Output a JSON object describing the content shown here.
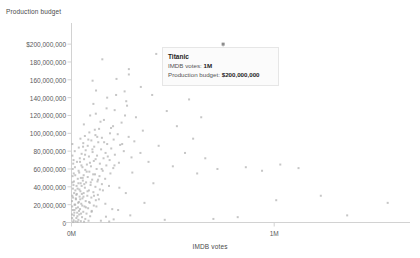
{
  "chart_data": {
    "type": "scatter",
    "title": "",
    "xlabel": "IMDB votes",
    "ylabel": "Production budget",
    "xlim": [
      0,
      1670000
    ],
    "ylim": [
      0,
      208000000
    ],
    "grid": false,
    "legend": "none",
    "x_ticks": [
      {
        "value": 0,
        "label": "0M"
      },
      {
        "value": 1000000,
        "label": "1M"
      }
    ],
    "y_ticks": [
      {
        "value": 0,
        "label": "0"
      },
      {
        "value": 20000000,
        "label": "20,000,000"
      },
      {
        "value": 40000000,
        "label": "40,000,000"
      },
      {
        "value": 60000000,
        "label": "60,000,000"
      },
      {
        "value": 80000000,
        "label": "80,000,000"
      },
      {
        "value": 100000000,
        "label": "100,000,000"
      },
      {
        "value": 120000000,
        "label": "120,000,000"
      },
      {
        "value": 140000000,
        "label": "140,000,000"
      },
      {
        "value": 160000000,
        "label": "160,000,000"
      },
      {
        "value": 180000000,
        "label": "180,000,000"
      },
      {
        "value": 200000000,
        "label": "$200,000,000"
      }
    ],
    "point_color": "#b0b0b0",
    "axis_color": "#d2d2d2",
    "highlight_color": "#8c8c8c",
    "series": [
      {
        "name": "films",
        "points": [
          [
            748000,
            200000000
          ],
          [
            748000,
            185000000
          ],
          [
            418000,
            189000000
          ],
          [
            152000,
            183000000
          ],
          [
            283000,
            172000000
          ],
          [
            283000,
            166000000
          ],
          [
            222000,
            161000000
          ],
          [
            104000,
            159000000
          ],
          [
            342000,
            152000000
          ],
          [
            121000,
            148000000
          ],
          [
            262000,
            147000000
          ],
          [
            398000,
            143000000
          ],
          [
            176000,
            140000000
          ],
          [
            270000,
            136000000
          ],
          [
            108000,
            133000000
          ],
          [
            274000,
            131000000
          ],
          [
            213000,
            126000000
          ],
          [
            120000,
            122000000
          ],
          [
            92000,
            120000000
          ],
          [
            318000,
            118000000
          ],
          [
            160000,
            115000000
          ],
          [
            247000,
            112000000
          ],
          [
            61000,
            110000000
          ],
          [
            205000,
            108000000
          ],
          [
            136000,
            105000000
          ],
          [
            352000,
            103000000
          ],
          [
            88000,
            101000000
          ],
          [
            190000,
            100000000
          ],
          [
            228000,
            99000000
          ],
          [
            118000,
            98000000
          ],
          [
            66000,
            97000000
          ],
          [
            282000,
            96000000
          ],
          [
            150000,
            95000000
          ],
          [
            44000,
            94000000
          ],
          [
            208000,
            93000000
          ],
          [
            98000,
            92000000
          ],
          [
            310000,
            91000000
          ],
          [
            132000,
            90000000
          ],
          [
            58000,
            89000000
          ],
          [
            176000,
            88000000
          ],
          [
            240000,
            87000000
          ],
          [
            80000,
            86000000
          ],
          [
            112000,
            85000000
          ],
          [
            36000,
            84000000
          ],
          [
            196000,
            83000000
          ],
          [
            146000,
            82000000
          ],
          [
            70000,
            81000000
          ],
          [
            258000,
            80000000
          ],
          [
            104000,
            79000000
          ],
          [
            168000,
            78000000
          ],
          [
            50000,
            77000000
          ],
          [
            214000,
            76000000
          ],
          [
            126000,
            75000000
          ],
          [
            86000,
            74000000
          ],
          [
            296000,
            73000000
          ],
          [
            158000,
            72000000
          ],
          [
            62000,
            71000000
          ],
          [
            188000,
            70000000
          ],
          [
            110000,
            69000000
          ],
          [
            42000,
            68000000
          ],
          [
            234000,
            67000000
          ],
          [
            140000,
            66000000
          ],
          [
            76000,
            65000000
          ],
          [
            172000,
            64000000
          ],
          [
            96000,
            63000000
          ],
          [
            54000,
            62000000
          ],
          [
            206000,
            61000000
          ],
          [
            124000,
            60000000
          ],
          [
            68000,
            59000000
          ],
          [
            154000,
            58000000
          ],
          [
            88000,
            57000000
          ],
          [
            38000,
            56000000
          ],
          [
            192000,
            55000000
          ],
          [
            116000,
            54000000
          ],
          [
            60000,
            53000000
          ],
          [
            138000,
            52000000
          ],
          [
            80000,
            51000000
          ],
          [
            46000,
            50000000
          ],
          [
            166000,
            49000000
          ],
          [
            102000,
            48000000
          ],
          [
            56000,
            47000000
          ],
          [
            128000,
            46000000
          ],
          [
            72000,
            45000000
          ],
          [
            34000,
            44000000
          ],
          [
            150000,
            43000000
          ],
          [
            94000,
            42000000
          ],
          [
            50000,
            41000000
          ],
          [
            118000,
            40000000
          ],
          [
            66000,
            39000000
          ],
          [
            30000,
            38000000
          ],
          [
            140000,
            37000000
          ],
          [
            86000,
            36000000
          ],
          [
            44000,
            35000000
          ],
          [
            108000,
            34000000
          ],
          [
            60000,
            33000000
          ],
          [
            26000,
            32000000
          ],
          [
            130000,
            31000000
          ],
          [
            78000,
            30000000
          ],
          [
            40000,
            29000000
          ],
          [
            98000,
            28000000
          ],
          [
            54000,
            27000000
          ],
          [
            22000,
            26000000
          ],
          [
            120000,
            25000000
          ],
          [
            70000,
            24000000
          ],
          [
            36000,
            23000000
          ],
          [
            90000,
            22000000
          ],
          [
            48000,
            21000000
          ],
          [
            18000,
            20000000
          ],
          [
            110000,
            19000000
          ],
          [
            64000,
            18000000
          ],
          [
            32000,
            17000000
          ],
          [
            82000,
            16000000
          ],
          [
            42000,
            15000000
          ],
          [
            15000,
            14000000
          ],
          [
            100000,
            13000000
          ],
          [
            58000,
            12000000
          ],
          [
            28000,
            11000000
          ],
          [
            74000,
            10000000
          ],
          [
            38000,
            9000000
          ],
          [
            12000,
            8000000
          ],
          [
            92000,
            7000000
          ],
          [
            52000,
            6000000
          ],
          [
            24000,
            5000000
          ],
          [
            68000,
            4000000
          ],
          [
            34000,
            3000000
          ],
          [
            10000,
            2500000
          ],
          [
            84000,
            2000000
          ],
          [
            46000,
            1500000
          ],
          [
            20000,
            1200000
          ],
          [
            62000,
            900000
          ],
          [
            30000,
            700000
          ],
          [
            8000,
            500000
          ],
          [
            470000,
            125000000
          ],
          [
            520000,
            108000000
          ],
          [
            600000,
            94000000
          ],
          [
            430000,
            86000000
          ],
          [
            560000,
            78000000
          ],
          [
            660000,
            72000000
          ],
          [
            380000,
            68000000
          ],
          [
            500000,
            63000000
          ],
          [
            720000,
            60000000
          ],
          [
            620000,
            55000000
          ],
          [
            860000,
            62000000
          ],
          [
            940000,
            58000000
          ],
          [
            1030000,
            65000000
          ],
          [
            1120000,
            61000000
          ],
          [
            1230000,
            30000000
          ],
          [
            1010000,
            25000000
          ],
          [
            1360000,
            8000000
          ],
          [
            820000,
            6000000
          ],
          [
            700000,
            4000000
          ],
          [
            460000,
            3000000
          ],
          [
            1560000,
            22000000
          ],
          [
            580000,
            138000000
          ],
          [
            640000,
            118000000
          ],
          [
            340000,
            78000000
          ],
          [
            300000,
            56000000
          ],
          [
            404000,
            44000000
          ],
          [
            268000,
            33000000
          ],
          [
            360000,
            22000000
          ],
          [
            230000,
            14000000
          ],
          [
            290000,
            8000000
          ],
          [
            170000,
            6500000
          ],
          [
            208000,
            3500000
          ],
          [
            145000,
            2000000
          ],
          [
            186000,
            1100000
          ],
          [
            4000,
            30000000
          ],
          [
            5000,
            45000000
          ],
          [
            3500,
            18000000
          ],
          [
            6000,
            60000000
          ],
          [
            4500,
            75000000
          ],
          [
            3000,
            9000000
          ],
          [
            7000,
            38000000
          ],
          [
            5500,
            52000000
          ],
          [
            2500,
            24000000
          ],
          [
            8500,
            66000000
          ],
          [
            6500,
            14000000
          ],
          [
            4200,
            88000000
          ],
          [
            9500,
            42000000
          ],
          [
            7500,
            28000000
          ],
          [
            3200,
            5000000
          ],
          [
            11000,
            55000000
          ],
          [
            13000,
            33000000
          ],
          [
            10000,
            70000000
          ],
          [
            15000,
            20000000
          ],
          [
            12000,
            46000000
          ],
          [
            17000,
            62000000
          ],
          [
            14000,
            11000000
          ],
          [
            19000,
            36000000
          ],
          [
            16000,
            80000000
          ],
          [
            21000,
            27000000
          ],
          [
            18500,
            53000000
          ],
          [
            23000,
            16000000
          ],
          [
            25000,
            41000000
          ],
          [
            27000,
            68000000
          ],
          [
            24000,
            31000000
          ],
          [
            29000,
            7000000
          ],
          [
            31000,
            49000000
          ],
          [
            33000,
            22000000
          ],
          [
            35000,
            58000000
          ],
          [
            37000,
            13000000
          ],
          [
            39000,
            37000000
          ],
          [
            41000,
            72000000
          ],
          [
            43000,
            26000000
          ],
          [
            45000,
            44000000
          ],
          [
            47000,
            10000000
          ],
          [
            49000,
            64000000
          ],
          [
            51000,
            32000000
          ],
          [
            53000,
            19000000
          ],
          [
            55000,
            50000000
          ],
          [
            57000,
            85000000
          ],
          [
            59000,
            29000000
          ],
          [
            63000,
            43000000
          ],
          [
            67000,
            76000000
          ],
          [
            71000,
            17000000
          ],
          [
            75000,
            57000000
          ],
          [
            79000,
            35000000
          ],
          [
            83000,
            93000000
          ],
          [
            87000,
            23000000
          ],
          [
            91000,
            67000000
          ],
          [
            95000,
            45000000
          ],
          [
            99000,
            12000000
          ],
          [
            103000,
            82000000
          ],
          [
            107000,
            54000000
          ],
          [
            111000,
            30000000
          ],
          [
            115000,
            104000000
          ],
          [
            119000,
            71000000
          ],
          [
            123000,
            18000000
          ],
          [
            127000,
            96000000
          ],
          [
            131000,
            48000000
          ],
          [
            135000,
            26000000
          ],
          [
            143000,
            113000000
          ],
          [
            149000,
            60000000
          ],
          [
            155000,
            36000000
          ],
          [
            161000,
            90000000
          ],
          [
            167000,
            21000000
          ],
          [
            173000,
            128000000
          ],
          [
            179000,
            74000000
          ],
          [
            185000,
            41000000
          ],
          [
            195000,
            106000000
          ],
          [
            201000,
            15000000
          ],
          [
            212000,
            64000000
          ],
          [
            220000,
            143000000
          ],
          [
            236000,
            39000000
          ],
          [
            250000,
            88000000
          ],
          [
            264000,
            120000000
          ]
        ]
      }
    ],
    "highlight": {
      "label": "Titanic",
      "x": 748000,
      "y": 200000000
    }
  },
  "tooltip": {
    "title": "Titanic",
    "rows": [
      {
        "label": "IMDB votes:",
        "value": "1M"
      },
      {
        "label": "Production budget:",
        "value": "$200,000,000"
      }
    ]
  }
}
